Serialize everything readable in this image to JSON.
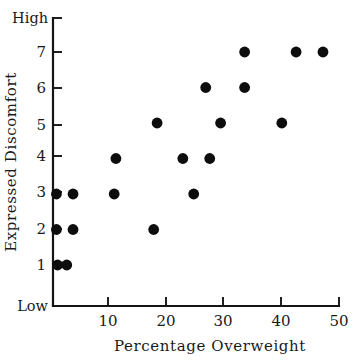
{
  "chart_data": {
    "type": "scatter",
    "title": "",
    "xlabel": "Percentage Overweight",
    "ylabel": "Expressed Discomfort",
    "xlim": [
      0,
      50
    ],
    "ylim": [
      0,
      8
    ],
    "grid": false,
    "legend": null,
    "x_ticks": [
      10,
      20,
      30,
      40,
      50
    ],
    "x_tick_labels": [
      "10",
      "20",
      "30",
      "40",
      "50"
    ],
    "y_ticks": [
      1,
      2,
      3,
      4,
      5,
      6,
      7
    ],
    "y_tick_labels": [
      "1",
      "2",
      "3",
      "4",
      "5",
      "6",
      "7"
    ],
    "y_axis_end_labels": {
      "high": "High",
      "low": "Low"
    },
    "marker": {
      "shape": "circle",
      "color": "#0d0d0d",
      "size_px": 5.4
    },
    "points": [
      {
        "x": 0.6,
        "y": 3
      },
      {
        "x": 3.5,
        "y": 3
      },
      {
        "x": 0.6,
        "y": 2
      },
      {
        "x": 3.5,
        "y": 2
      },
      {
        "x": 0.8,
        "y": 1
      },
      {
        "x": 2.4,
        "y": 1
      },
      {
        "x": 10.7,
        "y": 3
      },
      {
        "x": 11.0,
        "y": 4
      },
      {
        "x": 17.6,
        "y": 2
      },
      {
        "x": 18.2,
        "y": 5
      },
      {
        "x": 22.7,
        "y": 4
      },
      {
        "x": 24.6,
        "y": 3
      },
      {
        "x": 26.7,
        "y": 6
      },
      {
        "x": 27.4,
        "y": 4
      },
      {
        "x": 29.3,
        "y": 5
      },
      {
        "x": 33.5,
        "y": 6
      },
      {
        "x": 33.5,
        "y": 7
      },
      {
        "x": 40.0,
        "y": 5
      },
      {
        "x": 42.5,
        "y": 7
      },
      {
        "x": 47.2,
        "y": 7
      }
    ]
  },
  "labels": {
    "x_axis_title": "Percentage Overweight",
    "y_axis_title": "Expressed Discomfort",
    "y_top_label": "High",
    "y_bottom_label": "Low",
    "x_tick_10": "10",
    "x_tick_20": "20",
    "x_tick_30": "30",
    "x_tick_40": "40",
    "x_tick_50": "50",
    "y_tick_1": "1",
    "y_tick_2": "2",
    "y_tick_3": "3",
    "y_tick_4": "4",
    "y_tick_5": "5",
    "y_tick_6": "6",
    "y_tick_7": "7"
  },
  "colors": {
    "background": "#ffffff",
    "axis": "#151515",
    "marker": "#0d0d0d",
    "text": "#1a1a1a"
  }
}
